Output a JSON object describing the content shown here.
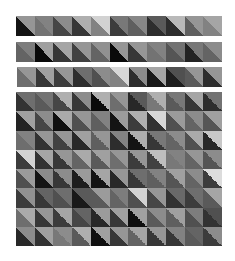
{
  "strips": [
    {
      "name": "strip-1",
      "box": {
        "x": 16,
        "y": 16,
        "w": 206,
        "h": 20
      },
      "tiles": [
        [
          150,
          20
        ],
        [
          130,
          115
        ],
        [
          140,
          70
        ],
        [
          175,
          55
        ],
        [
          210,
          130
        ],
        [
          120,
          60
        ],
        [
          135,
          95
        ],
        [
          90,
          45
        ],
        [
          185,
          45
        ],
        [
          150,
          95
        ],
        [
          165,
          130
        ]
      ]
    },
    {
      "name": "strip-2",
      "box": {
        "x": 16,
        "y": 42,
        "w": 206,
        "h": 20
      },
      "tiles": [
        [
          125,
          100
        ],
        [
          160,
          10
        ],
        [
          165,
          55
        ],
        [
          150,
          65
        ],
        [
          145,
          100
        ],
        [
          150,
          10
        ],
        [
          150,
          55
        ],
        [
          130,
          115
        ],
        [
          115,
          85
        ],
        [
          120,
          35
        ],
        [
          140,
          100
        ]
      ]
    },
    {
      "name": "strip-3",
      "box": {
        "x": 17,
        "y": 67,
        "w": 205,
        "h": 20
      },
      "tiles": [
        [
          150,
          110
        ],
        [
          160,
          55
        ],
        [
          150,
          60
        ],
        [
          110,
          45
        ],
        [
          140,
          80
        ],
        [
          215,
          130
        ],
        [
          140,
          45
        ],
        [
          165,
          25
        ],
        [
          80,
          30
        ],
        [
          150,
          90
        ],
        [
          150,
          45
        ]
      ]
    }
  ],
  "grid": {
    "name": "tile-grid",
    "box": {
      "x": 16,
      "y": 92,
      "w": 206,
      "h": 154
    },
    "cols": 11,
    "rows": 8,
    "tiles": [
      [
        [
          110,
          50
        ],
        [
          115,
          90
        ],
        [
          175,
          70
        ],
        [
          140,
          55
        ],
        [
          175,
          10
        ],
        [
          150,
          110
        ],
        [
          90,
          40
        ],
        [
          175,
          120
        ],
        [
          120,
          90
        ],
        [
          165,
          55
        ],
        [
          115,
          45
        ]
      ],
      [
        [
          160,
          35
        ],
        [
          140,
          70
        ],
        [
          170,
          15
        ],
        [
          150,
          80
        ],
        [
          130,
          95
        ],
        [
          155,
          20
        ],
        [
          175,
          60
        ],
        [
          215,
          50
        ],
        [
          155,
          80
        ],
        [
          140,
          100
        ],
        [
          160,
          85
        ]
      ],
      [
        [
          130,
          110
        ],
        [
          150,
          50
        ],
        [
          150,
          65
        ],
        [
          160,
          40
        ],
        [
          150,
          95
        ],
        [
          130,
          45
        ],
        [
          175,
          20
        ],
        [
          120,
          55
        ],
        [
          140,
          100
        ],
        [
          170,
          80
        ],
        [
          200,
          40
        ]
      ],
      [
        [
          210,
          60
        ],
        [
          165,
          50
        ],
        [
          150,
          55
        ],
        [
          170,
          100
        ],
        [
          160,
          90
        ],
        [
          150,
          110
        ],
        [
          150,
          60
        ],
        [
          190,
          65
        ],
        [
          130,
          120
        ],
        [
          150,
          100
        ],
        [
          140,
          85
        ]
      ],
      [
        [
          155,
          80
        ],
        [
          140,
          20
        ],
        [
          140,
          55
        ],
        [
          155,
          30
        ],
        [
          165,
          20
        ],
        [
          150,
          40
        ],
        [
          110,
          55
        ],
        [
          130,
          95
        ],
        [
          160,
          85
        ],
        [
          140,
          100
        ],
        [
          220,
          60
        ]
      ],
      [
        [
          145,
          60
        ],
        [
          100,
          55
        ],
        [
          110,
          80
        ],
        [
          90,
          25
        ],
        [
          155,
          90
        ],
        [
          125,
          100
        ],
        [
          210,
          80
        ],
        [
          150,
          70
        ],
        [
          105,
          50
        ],
        [
          110,
          60
        ],
        [
          165,
          90
        ]
      ],
      [
        [
          170,
          110
        ],
        [
          150,
          55
        ],
        [
          165,
          60
        ],
        [
          100,
          70
        ],
        [
          155,
          40
        ],
        [
          160,
          55
        ],
        [
          160,
          15
        ],
        [
          140,
          90
        ],
        [
          160,
          95
        ],
        [
          125,
          80
        ],
        [
          80,
          50
        ]
      ],
      [
        [
          140,
          40
        ],
        [
          160,
          50
        ],
        [
          140,
          120
        ],
        [
          175,
          90
        ],
        [
          160,
          15
        ],
        [
          150,
          55
        ],
        [
          165,
          100
        ],
        [
          150,
          55
        ],
        [
          130,
          55
        ],
        [
          100,
          90
        ],
        [
          140,
          60
        ]
      ]
    ]
  }
}
